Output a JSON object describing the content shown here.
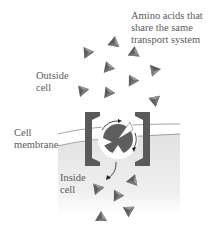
{
  "labels": {
    "amino_acids": [
      "Amino acids that",
      "share the same",
      "transport system"
    ],
    "outside": [
      "Outside",
      "cell"
    ],
    "membrane": [
      "Cell",
      "membrane"
    ],
    "inside": [
      "Inside",
      "cell"
    ]
  },
  "colors": {
    "molecule_dark": "#5e5e5e",
    "molecule_light": "#9a9a9a",
    "transporter": "#5a5a5a",
    "cytoplasm": "#e8e8e8",
    "membrane_line": "#888888"
  }
}
